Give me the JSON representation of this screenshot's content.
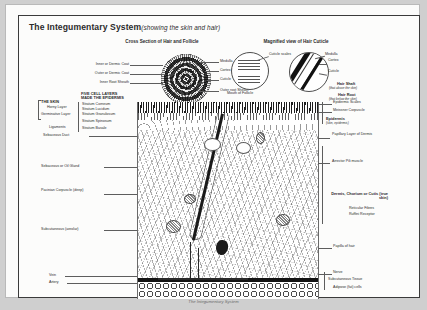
{
  "page": {
    "title_main": "The Integumentary System",
    "title_sub": "(showing the skin and hair)",
    "caption": "The Integumentary System",
    "bg_color": "#cfcfcf",
    "sheet_color": "#fbfbfa",
    "ink_color": "#2b2b2b"
  },
  "panels": {
    "cross_section_heading": "Cross Section of Hair and Follicle",
    "magnified_heading": "Magnified view of Hair Cuticle"
  },
  "cross_section_labels": {
    "left": [
      "Inner or Dermic Coat",
      "Outer or Dermic Coat",
      "Inner Root Sheath"
    ],
    "right": [
      "Medulla",
      "Cortex",
      "Cuticle",
      "Outer root Sheath"
    ]
  },
  "magnified_labels": {
    "cuticle_scales": "Cuticle scales",
    "mouth_of_follicle": "Mouth of Follicle",
    "medulla": "Medulla",
    "cortex": "Cortex",
    "cuticle": "Cuticle"
  },
  "hair_labels": {
    "shaft": "Hair Shaft",
    "shaft_note": "(that above the skin)",
    "root": "Hair Root",
    "root_note": "(that below the skin)"
  },
  "skin_key": {
    "heading": "THE SKIN",
    "sub_items": [
      "Horny Layer",
      "Germinative Layer"
    ],
    "ligaments": "Ligaments",
    "sebaceous_duct": "Sebaceous Duct"
  },
  "structure_key": {
    "heading": "FIVE CELL LAYERS",
    "subheading": "MADE THE EPIDERMIS",
    "items": [
      "Stratum Corneum",
      "Stratum Lucidum",
      "Stratum Granulosum",
      "Stratum Spinosum",
      "Stratum Basale"
    ]
  },
  "left_labels": [
    "Sebaceous or Oil Gland",
    "Pacinian Corpuscle (deep)",
    "Subcutaneous (areolar)",
    "Vein",
    "Artery"
  ],
  "right_labels": [
    "Epidermic Scales",
    "Meissner Corpuscle",
    "Epidermis",
    "(skin, epidermis)",
    "Papillary Layer of Dermis",
    "Arrector Pili muscle",
    "Dermis, Chorium or Cutis (true skin)",
    "Reticular Fibres",
    "Ruffini Receptor",
    "Papilla of hair",
    "Nerve",
    "Subcutaneous Tissue",
    "Adipose (fat) cells"
  ]
}
